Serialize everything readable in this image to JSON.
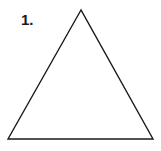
{
  "figure": {
    "label": "1.",
    "shape": "triangle",
    "vertices": [
      [
        81,
        10
      ],
      [
        8,
        139
      ],
      [
        153,
        139
      ]
    ],
    "stroke_color": "#1a1a1a"
  }
}
